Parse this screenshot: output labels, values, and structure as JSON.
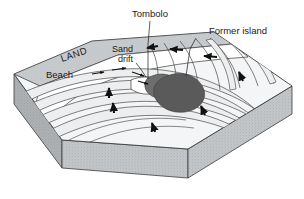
{
  "figure": {
    "background_color": "#ffffff"
  },
  "labels": {
    "tombolo": "Tombolo",
    "former_island": "Former island",
    "sand_drift_line1": "Sand",
    "sand_drift_line2": "drift",
    "land": "LAND",
    "beach": "Beach"
  },
  "colors": {
    "outline": "#3c3c3c",
    "sea_surface": "#f4f5f6",
    "wave_band": "#eceef0",
    "land_strip": "#c9ccce",
    "land_strip_dark": "#b4b8bb",
    "block_front": "#bfc3c5",
    "block_side": "#a9adb0",
    "island": "#5a5a5a",
    "island_light": "#6e6e6e",
    "beach_white": "#ffffff",
    "arrow": "#111111",
    "leader": "#1a1a1a"
  },
  "icons": {
    "wave_arrow": "arrow-up-icon",
    "drift_arrow": "arrow-right-icon",
    "refraction_arrow": "arrow-left-icon",
    "leader_line": "leader-line-icon"
  },
  "elements": {
    "block": "3d-block",
    "sea": "sea-surface",
    "island_shape": "former-island-shape",
    "tombolo_bar": "tombolo-sand-bar",
    "wave_crests": "wave-crest-lines",
    "beach_shore": "beach-shoreline"
  }
}
